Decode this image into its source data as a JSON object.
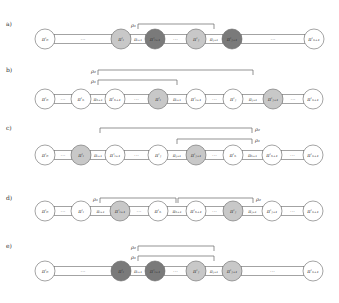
{
  "colors": {
    "white": "#ffffff",
    "light": "#c8c8c8",
    "dark": "#7a7a7a",
    "stroke": "#666666",
    "bracket": "#666666"
  },
  "rows": [
    {
      "label": "a)",
      "y": 39,
      "nodes": [
        {
          "x": 45,
          "text": "π'₀",
          "fill": "white"
        },
        {
          "x": 121,
          "text": "π'ᵢ",
          "fill": "light"
        },
        {
          "x": 155,
          "text": "π'ᵢ₊₁",
          "fill": "dark"
        },
        {
          "x": 196,
          "text": "π'ⱼ",
          "fill": "light"
        },
        {
          "x": 232,
          "text": "π'ⱼ₊₁",
          "fill": "dark"
        },
        {
          "x": 314,
          "text": "π'ₙ₊₁",
          "fill": "white"
        }
      ],
      "links": [
        {
          "from": 0,
          "to": 1,
          "text": "···",
          "type": "dots"
        },
        {
          "from": 1,
          "to": 2,
          "text": "πᵢ₊₁",
          "type": "edge"
        },
        {
          "from": 2,
          "to": 3,
          "text": "···",
          "type": "dots"
        },
        {
          "from": 3,
          "to": 4,
          "text": "πⱼ₊₁",
          "type": "edge"
        },
        {
          "from": 4,
          "to": 5,
          "text": "···",
          "type": "dots"
        }
      ],
      "brackets": [
        {
          "label": "ρ₁",
          "x1": 138,
          "x2": 214,
          "y": 24,
          "label_side": "left"
        }
      ]
    },
    {
      "label": "b)",
      "y": 99,
      "nodes": [
        {
          "x": 45,
          "text": "π'₀",
          "fill": "white"
        },
        {
          "x": 81,
          "text": "π'ₕ",
          "fill": "white"
        },
        {
          "x": 115,
          "text": "π'ₕ₊₁",
          "fill": "white"
        },
        {
          "x": 158,
          "text": "π'ᵢ",
          "fill": "light"
        },
        {
          "x": 196,
          "text": "π'ᵢ₊₁",
          "fill": "white"
        },
        {
          "x": 233,
          "text": "π'ⱼ",
          "fill": "white"
        },
        {
          "x": 273,
          "text": "π'ⱼ₊₁",
          "fill": "light"
        },
        {
          "x": 313,
          "text": "π'ₙ₊₁",
          "fill": "white"
        }
      ],
      "links": [
        {
          "from": 0,
          "to": 1,
          "text": "···",
          "type": "dots"
        },
        {
          "from": 1,
          "to": 2,
          "text": "πₕ₊₁",
          "type": "edge"
        },
        {
          "from": 2,
          "to": 3,
          "text": "···",
          "type": "dots"
        },
        {
          "from": 3,
          "to": 4,
          "text": "πᵢ₊₁",
          "type": "edge"
        },
        {
          "from": 4,
          "to": 5,
          "text": "···",
          "type": "dots"
        },
        {
          "from": 5,
          "to": 6,
          "text": "πⱼ₊₁",
          "type": "edge"
        },
        {
          "from": 6,
          "to": 7,
          "text": "···",
          "type": "dots"
        }
      ],
      "brackets": [
        {
          "label": "ρ₂",
          "x1": 98,
          "x2": 253,
          "y": 70,
          "label_side": "left"
        },
        {
          "label": "ρ₁",
          "x1": 98,
          "x2": 177,
          "y": 80,
          "label_side": "left"
        }
      ]
    },
    {
      "label": "c)",
      "y": 155,
      "nodes": [
        {
          "x": 45,
          "text": "π'₀",
          "fill": "white"
        },
        {
          "x": 81,
          "text": "π'ᵢ",
          "fill": "light"
        },
        {
          "x": 115,
          "text": "π'ᵢ₊₁",
          "fill": "white"
        },
        {
          "x": 158,
          "text": "π'ⱼ",
          "fill": "white"
        },
        {
          "x": 196,
          "text": "π'ⱼ₊₁",
          "fill": "light"
        },
        {
          "x": 233,
          "text": "π'ₕ",
          "fill": "white"
        },
        {
          "x": 272,
          "text": "π'ₕ₊₁",
          "fill": "white"
        },
        {
          "x": 313,
          "text": "π'ₙ₊₁",
          "fill": "white"
        }
      ],
      "links": [
        {
          "from": 0,
          "to": 1,
          "text": "···",
          "type": "dots"
        },
        {
          "from": 1,
          "to": 2,
          "text": "πᵢ₊₁",
          "type": "edge"
        },
        {
          "from": 2,
          "to": 3,
          "text": "···",
          "type": "dots"
        },
        {
          "from": 3,
          "to": 4,
          "text": "πⱼ₊₁",
          "type": "edge"
        },
        {
          "from": 4,
          "to": 5,
          "text": "···",
          "type": "dots"
        },
        {
          "from": 5,
          "to": 6,
          "text": "πₕ₊₁",
          "type": "edge"
        },
        {
          "from": 6,
          "to": 7,
          "text": "···",
          "type": "dots"
        }
      ],
      "brackets": [
        {
          "label": "ρ₂",
          "x1": 100,
          "x2": 252,
          "y": 128,
          "label_side": "right"
        },
        {
          "label": "ρ₁",
          "x1": 177,
          "x2": 252,
          "y": 139,
          "label_side": "right"
        }
      ]
    },
    {
      "label": "d)",
      "y": 211,
      "nodes": [
        {
          "x": 45,
          "text": "π'₀",
          "fill": "white"
        },
        {
          "x": 81,
          "text": "π'ᵢ",
          "fill": "white"
        },
        {
          "x": 120,
          "text": "π'ᵢ₊₁",
          "fill": "light"
        },
        {
          "x": 158,
          "text": "π'ₕ",
          "fill": "white"
        },
        {
          "x": 196,
          "text": "π'ₕ₊₁",
          "fill": "white"
        },
        {
          "x": 233,
          "text": "π'ⱼ",
          "fill": "light"
        },
        {
          "x": 272,
          "text": "π'ⱼ₊₁",
          "fill": "white"
        },
        {
          "x": 313,
          "text": "π'ₙ₊₁",
          "fill": "white"
        }
      ],
      "links": [
        {
          "from": 0,
          "to": 1,
          "text": "···",
          "type": "dots"
        },
        {
          "from": 1,
          "to": 2,
          "text": "πᵢ₊₁",
          "type": "edge"
        },
        {
          "from": 2,
          "to": 3,
          "text": "···",
          "type": "dots"
        },
        {
          "from": 3,
          "to": 4,
          "text": "πₕ₊₁",
          "type": "edge"
        },
        {
          "from": 4,
          "to": 5,
          "text": "···",
          "type": "dots"
        },
        {
          "from": 5,
          "to": 6,
          "text": "πⱼ₊₁",
          "type": "edge"
        },
        {
          "from": 6,
          "to": 7,
          "text": "···",
          "type": "dots"
        }
      ],
      "brackets": [
        {
          "label": "ρ₁",
          "x1": 100,
          "x2": 176,
          "y": 198,
          "label_side": "left"
        },
        {
          "label": "ρ₂",
          "x1": 178,
          "x2": 253,
          "y": 198,
          "label_side": "right"
        }
      ]
    },
    {
      "label": "e)",
      "y": 271,
      "nodes": [
        {
          "x": 45,
          "text": "π'₀",
          "fill": "white"
        },
        {
          "x": 121,
          "text": "π'ᵢ",
          "fill": "dark"
        },
        {
          "x": 155,
          "text": "π'ᵢ₊₁",
          "fill": "dark"
        },
        {
          "x": 196,
          "text": "π'ⱼ",
          "fill": "light"
        },
        {
          "x": 232,
          "text": "π'ⱼ₊₁",
          "fill": "light"
        },
        {
          "x": 313,
          "text": "π'ₙ₊₁",
          "fill": "white"
        }
      ],
      "links": [
        {
          "from": 0,
          "to": 1,
          "text": "···",
          "type": "dots"
        },
        {
          "from": 1,
          "to": 2,
          "text": "πᵢ₊₁",
          "type": "edge"
        },
        {
          "from": 2,
          "to": 3,
          "text": "···",
          "type": "dots"
        },
        {
          "from": 3,
          "to": 4,
          "text": "πⱼ₊₁",
          "type": "edge"
        },
        {
          "from": 4,
          "to": 5,
          "text": "···",
          "type": "dots"
        }
      ],
      "brackets": [
        {
          "label": "ρ₂",
          "x1": 138,
          "x2": 214,
          "y": 246,
          "label_side": "left"
        },
        {
          "label": "ρ₁",
          "x1": 138,
          "x2": 214,
          "y": 256,
          "label_side": "left"
        }
      ]
    }
  ]
}
